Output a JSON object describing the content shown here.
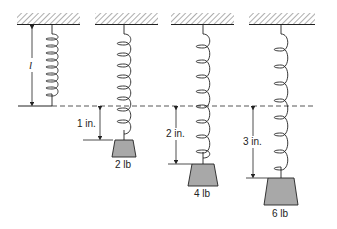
{
  "diagram": {
    "reference_line": "dashed equilibrium line",
    "natural_length_label": "l",
    "colors": {
      "ink": "#222222",
      "weight_fill": "#a8a8a8",
      "hatch": "#777777"
    },
    "springs": [
      {
        "id": "unloaded",
        "weight_label": "",
        "extension_label": ""
      },
      {
        "id": "load-2",
        "weight_label": "2 lb",
        "extension_label": "1 in."
      },
      {
        "id": "load-4",
        "weight_label": "4 lb",
        "extension_label": "2 in."
      },
      {
        "id": "load-6",
        "weight_label": "6 lb",
        "extension_label": "3 in."
      }
    ]
  }
}
